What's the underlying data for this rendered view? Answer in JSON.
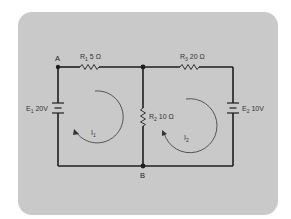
{
  "diagram": {
    "type": "two-loop DC circuit (mesh analysis)",
    "nodes": [
      {
        "id": "A",
        "label": "A"
      },
      {
        "id": "B",
        "label": "B"
      }
    ],
    "components": {
      "R1": {
        "name": "R",
        "sub": "1",
        "value": "5 Ω",
        "label": "R1 5 Ω"
      },
      "R2": {
        "name": "R",
        "sub": "2",
        "value": "10 Ω",
        "label": "R2 10 Ω"
      },
      "R3": {
        "name": "R",
        "sub": "3",
        "value": "20 Ω",
        "label": "R3 20 Ω"
      },
      "E1": {
        "name": "E",
        "sub": "1",
        "value": "20V",
        "label": "E1 20V"
      },
      "E2": {
        "name": "E",
        "sub": "2",
        "value": "10V",
        "label": "E2 10V"
      }
    },
    "loops": [
      {
        "name": "I",
        "sub": "1",
        "direction": "clockwise"
      },
      {
        "name": "I",
        "sub": "2",
        "direction": "clockwise"
      }
    ],
    "colors": {
      "panel": "#c9c9c9",
      "wire": "#1e1e1e",
      "arrow": "#555555"
    }
  }
}
